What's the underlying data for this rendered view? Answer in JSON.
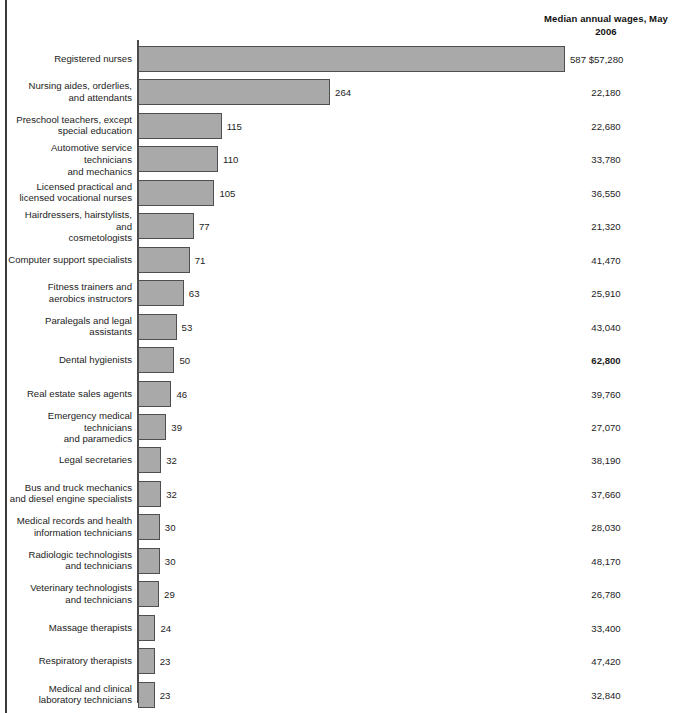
{
  "header": {
    "wages_column_title": "Median annual\nwages, May 2006"
  },
  "chart_data": {
    "type": "bar",
    "orientation": "horizontal",
    "title": "",
    "subtitle": "",
    "xlabel": "",
    "ylabel": "",
    "xlim": [
      0,
      587
    ],
    "grid": false,
    "legend": null,
    "value_unit": "thousands of jobs",
    "bar_color": "#a9a9a9",
    "bar_border_color": "#4f4f4f",
    "categories": [
      "Registered nurses",
      "Nursing aides, orderlies,\nand attendants",
      "Preschool teachers, except\nspecial education",
      "Automotive service technicians\nand mechanics",
      "Licensed practical and\nlicensed vocational nurses",
      "Hairdressers, hairstylists, and\ncosmetologists",
      "Computer support specialists",
      "Fitness trainers and\naerobics instructors",
      "Paralegals and legal assistants",
      "Dental hygienists",
      "Real estate sales agents",
      "Emergency medical technicians\nand paramedics",
      "Legal secretaries",
      "Bus and truck mechanics\nand diesel engine specialists",
      "Medical records and health\ninformation technicians",
      "Radiologic technologists\nand technicians",
      "Veterinary technologists\nand technicians",
      "Massage therapists",
      "Respiratory therapists",
      "Medical and clinical\nlaboratory technicians"
    ],
    "values": [
      587,
      264,
      115,
      110,
      105,
      77,
      71,
      63,
      53,
      50,
      46,
      39,
      32,
      32,
      30,
      30,
      29,
      24,
      23,
      23
    ],
    "value_labels": [
      "587",
      "264",
      "115",
      "110",
      "105",
      "77",
      "71",
      "63",
      "53",
      "50",
      "46",
      "39",
      "32",
      "32",
      "30",
      "30",
      "29",
      "24",
      "23",
      "23"
    ],
    "annotations": {
      "wages_column_header": "Median annual wages, May 2006",
      "wages": [
        "$57,280",
        "22,180",
        "22,680",
        "33,780",
        "36,550",
        "21,320",
        "41,470",
        "25,910",
        "43,040",
        "62,800",
        "39,760",
        "27,070",
        "38,190",
        "37,660",
        "28,030",
        "48,170",
        "26,780",
        "33,400",
        "47,420",
        "32,840"
      ],
      "wages_bold_index": 9
    }
  }
}
